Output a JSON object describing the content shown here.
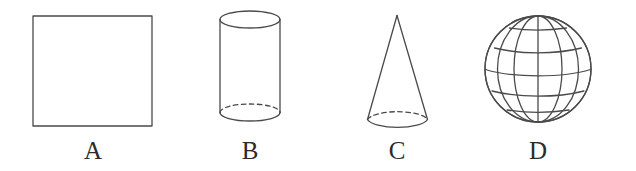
{
  "page": {
    "background_color": "#ffffff",
    "stroke_color": "#4a4a4a",
    "label_color": "#2b2b2b",
    "width": 636,
    "height": 171
  },
  "figures": [
    {
      "id": "A",
      "label": "A",
      "shape_name": "square",
      "icon": "square-outline-icon",
      "geometry": {
        "x": 33,
        "y": 16,
        "width": 119,
        "height": 110
      }
    },
    {
      "id": "B",
      "label": "B",
      "shape_name": "cylinder",
      "icon": "cylinder-outline-icon",
      "geometry": {
        "center_x": 250,
        "top_y": 19,
        "bottom_y": 113,
        "rx": 30,
        "ry": 8.5
      }
    },
    {
      "id": "C",
      "label": "C",
      "shape_name": "cone",
      "icon": "cone-outline-icon",
      "geometry": {
        "apex_x": 397,
        "apex_y": 15,
        "base_y": 111,
        "rx": 30,
        "ry": 9
      }
    },
    {
      "id": "D",
      "label": "D",
      "shape_name": "sphere",
      "icon": "globe-sphere-outline-icon",
      "geometry": {
        "center_x": 538,
        "center_y": 69,
        "radius": 53
      }
    }
  ]
}
